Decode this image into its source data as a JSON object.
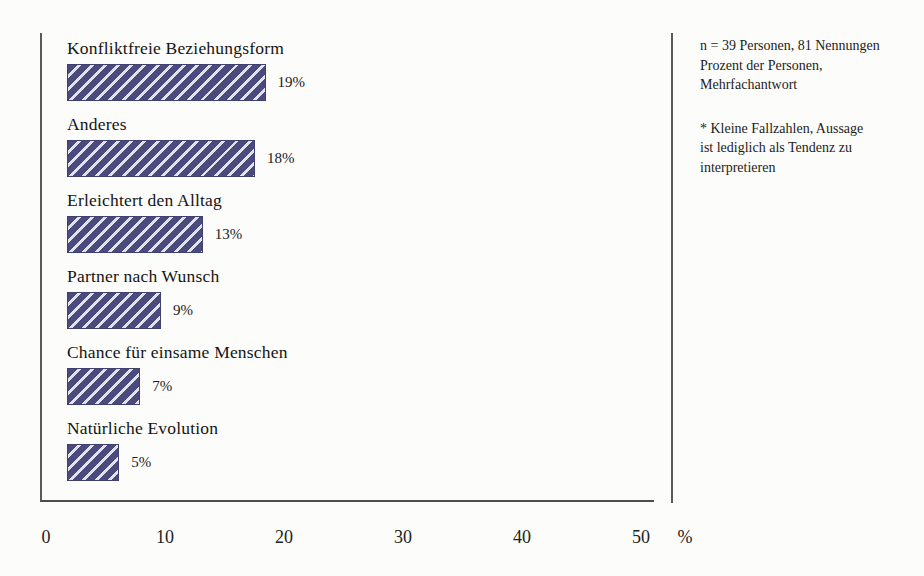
{
  "chart_data": {
    "type": "bar",
    "orientation": "horizontal",
    "categories": [
      "Konfliktfreie Beziehungsform",
      "Anderes",
      "Erleichtert den Alltag",
      "Partner nach Wunsch",
      "Chance für einsame Menschen",
      "Natürliche Evolution"
    ],
    "values": [
      19,
      18,
      13,
      9,
      7,
      5
    ],
    "value_labels": [
      "19%",
      "18%",
      "13%",
      "9%",
      "7%",
      "5%"
    ],
    "title": "",
    "xlabel": "%",
    "ylabel": "",
    "xlim": [
      0,
      50
    ],
    "xticks": [
      0,
      10,
      20,
      30,
      40,
      50
    ],
    "grid": false,
    "legend": "none",
    "bar_style": {
      "fill_color": "#4a4a7d",
      "hatch_color": "#e2e2ec",
      "hatch": "diagonal-stripes-forward"
    }
  },
  "notes": {
    "sample_lines": [
      "n = 39 Personen, 81 Nennungen",
      "Prozent der Personen,",
      "Mehrfachantwort"
    ],
    "footnote_lines": [
      "* Kleine Fallzahlen, Aussage",
      "ist lediglich als Tendenz zu",
      "interpretieren"
    ]
  }
}
